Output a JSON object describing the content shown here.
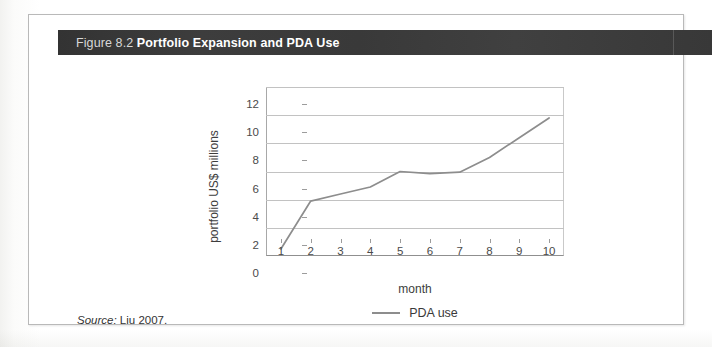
{
  "figure": {
    "number": "Figure 8.2",
    "title": "Portfolio Expansion and PDA Use",
    "source_keyword": "Source:",
    "source_text": "Liu 2007."
  },
  "chart_data": {
    "type": "line",
    "title": "Portfolio Expansion and PDA Use",
    "xlabel": "month",
    "ylabel": "portfolio US$ millions",
    "x": [
      1,
      2,
      3,
      4,
      5,
      6,
      7,
      8,
      9,
      10
    ],
    "xtick_labels": [
      "1",
      "2",
      "3",
      "4",
      "5",
      "6",
      "7",
      "8",
      "9",
      "10"
    ],
    "ytick_labels": [
      "0",
      "2",
      "4",
      "6",
      "8",
      "10",
      "12"
    ],
    "yticks": [
      0,
      2,
      4,
      6,
      8,
      10,
      12
    ],
    "ylim": [
      0,
      12
    ],
    "xlim": [
      0.5,
      10.5
    ],
    "grid": "horizontal",
    "legend_position": "bottom-center",
    "series": [
      {
        "name": "PDA use",
        "color": "#8d8d8d",
        "values": [
          0.5,
          3.9,
          4.4,
          4.9,
          6.0,
          5.85,
          5.95,
          7.0,
          8.4,
          9.8
        ]
      }
    ]
  },
  "legend": {
    "entries": [
      {
        "label": "PDA use",
        "swatch": "line-swatch"
      }
    ]
  },
  "colors": {
    "caption_bar": "#3a3a3a",
    "caption_text": "#ffffff",
    "series_line": "#8d8d8d",
    "gridline": "#c2c2c2",
    "frame_border": "#b9b9b9"
  }
}
